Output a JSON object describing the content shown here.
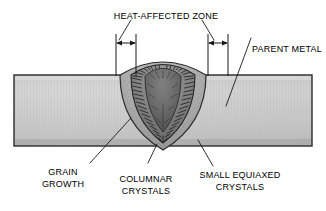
{
  "figure": {
    "title": "HEAT-AFFECTED ZONE",
    "type": "weld-cross-section-diagram"
  },
  "labels": {
    "heat_affected_zone": "HEAT-AFFECTED ZONE",
    "parent_metal": "PARENT METAL",
    "grain_growth_line1": "GRAIN",
    "grain_growth_line2": "GROWTH",
    "columnar_line1": "COLUMNAR",
    "columnar_line2": "CRYSTALS",
    "equiaxed_line1": "SMALL EQUIAXED",
    "equiaxed_line2": "CRYSTALS"
  },
  "regions": {
    "parent_metal_name": "parent-metal-plate",
    "haz_name": "heat-affected-zone-band",
    "fusion_zone_name": "fusion-zone-columnar",
    "weld_center_name": "weld-center-equiaxed"
  },
  "colors": {
    "outline": "#1a1a1a",
    "plate_light": "#d8d8d8",
    "plate_mid": "#bcbcbc",
    "plate_dark": "#a8a8a8",
    "haz_light": "#b8b8b8",
    "haz_dark": "#9a9a9a",
    "fusion_light": "#8f8f8f",
    "fusion_dark": "#6e6e6e",
    "center_light": "#7a7a7a",
    "center_dark": "#555555",
    "hatch": "#2b2b2b",
    "leader": "#1a1a1a",
    "text": "#000000",
    "background": "#ffffff"
  },
  "geometry": {
    "plate_top_y": 75,
    "plate_bottom_y": 146,
    "plate_left_x": 14,
    "plate_right_x": 312,
    "weld_center_x": 163,
    "weld_crown_y": 62,
    "weld_root_y": 147,
    "haz_left_marker_x1": 115,
    "haz_left_marker_x2": 135,
    "haz_right_marker_x1": 207,
    "haz_right_marker_x2": 227,
    "marker_y": 43
  },
  "annotations": {
    "dimension_marker_left": "haz-width-left",
    "dimension_marker_right": "haz-width-right",
    "leader_count": 6
  }
}
